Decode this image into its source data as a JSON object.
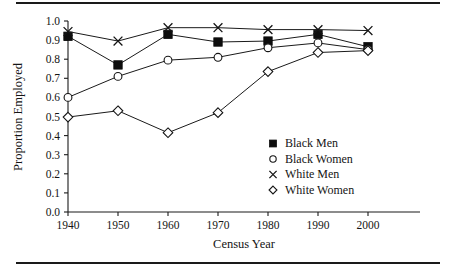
{
  "figure": {
    "has_top_rule": true,
    "has_bottom_rule": true,
    "background": "#ffffff",
    "ink_color": "#141414"
  },
  "chart_data": {
    "type": "line",
    "title": "",
    "xlabel": "Census Year",
    "ylabel": "Proportion Employed",
    "x": [
      1940,
      1950,
      1960,
      1970,
      1980,
      1990,
      2000
    ],
    "categories": [
      "1940",
      "1950",
      "1960",
      "1970",
      "1980",
      "1990",
      "2000"
    ],
    "xlim": [
      1935,
      2005
    ],
    "ylim": [
      0.0,
      1.0
    ],
    "ytick_labels": [
      "0.0",
      "0.1",
      "0.2",
      "0.3",
      "0.4",
      "0.5",
      "0.6",
      "0.7",
      "0.8",
      "0.9",
      "1.0"
    ],
    "ytick_values": [
      0.0,
      0.1,
      0.2,
      0.3,
      0.4,
      0.5,
      0.6,
      0.7,
      0.8,
      0.9,
      1.0
    ],
    "xtick_labels": [
      "1940",
      "1950",
      "1960",
      "1970",
      "1980",
      "1990",
      "2000"
    ],
    "grid": false,
    "legend_position": "center-right",
    "series": [
      {
        "name": "Black Men",
        "marker": "filled-square",
        "values": [
          0.92,
          0.77,
          0.93,
          0.89,
          0.895,
          0.93,
          0.865
        ]
      },
      {
        "name": "Black Women",
        "marker": "open-circle",
        "values": [
          0.6,
          0.71,
          0.795,
          0.81,
          0.86,
          0.885,
          0.85
        ]
      },
      {
        "name": "White Men",
        "marker": "cross",
        "values": [
          0.945,
          0.895,
          0.965,
          0.965,
          0.955,
          0.955,
          0.95
        ]
      },
      {
        "name": "White Women",
        "marker": "open-diamond",
        "values": [
          0.497,
          0.53,
          0.415,
          0.52,
          0.735,
          0.835,
          0.845
        ]
      }
    ]
  },
  "legend": {
    "entries": [
      {
        "label": "Black Men",
        "marker": "filled-square"
      },
      {
        "label": "Black Women",
        "marker": "open-circle"
      },
      {
        "label": "White Men",
        "marker": "cross"
      },
      {
        "label": "White Women",
        "marker": "open-diamond"
      }
    ]
  }
}
